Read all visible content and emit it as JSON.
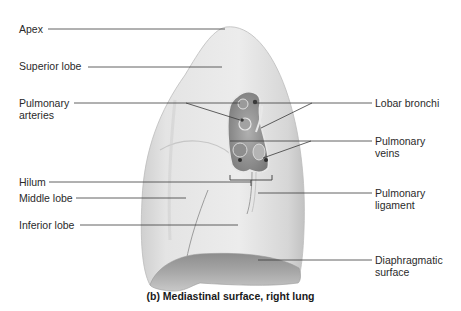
{
  "figure": {
    "caption": "(b) Mediastinal surface, right lung"
  },
  "labels_left": [
    {
      "id": "apex",
      "text": "Apex"
    },
    {
      "id": "superior-lobe",
      "text": "Superior lobe"
    },
    {
      "id": "pulmonary-arteries",
      "line1": "Pulmonary",
      "line2": "arteries"
    },
    {
      "id": "hilum",
      "text": "Hilum"
    },
    {
      "id": "middle-lobe",
      "text": "Middle lobe"
    },
    {
      "id": "inferior-lobe",
      "text": "Inferior lobe"
    }
  ],
  "labels_right": [
    {
      "id": "lobar-bronchi",
      "text": "Lobar bronchi"
    },
    {
      "id": "pulmonary-veins",
      "line1": "Pulmonary",
      "line2": "veins"
    },
    {
      "id": "pulmonary-ligament",
      "line1": "Pulmonary",
      "line2": "ligament"
    },
    {
      "id": "diaphragmatic-surface",
      "line1": "Diaphragmatic",
      "line2": "surface"
    }
  ],
  "colors": {
    "lung_fill": "#e6e6e6",
    "lung_shadow": "#c4c4c4",
    "hilum_dark": "#8a8a8a",
    "leader_line": "#3a3a3a",
    "text": "#2a2a2a"
  }
}
